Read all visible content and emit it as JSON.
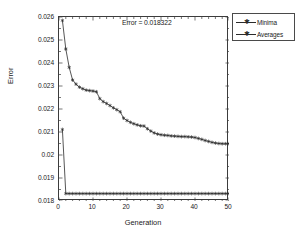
{
  "figure": {
    "background": "#ffffff",
    "axis_color": "#3c3c3c",
    "series_color": "#2b2b2b"
  },
  "annotation": {
    "text": "Error = 0.018322"
  },
  "axis": {
    "xlabel": "Generation",
    "ylabel": "Error",
    "yticks": [
      "0.018",
      "0.019",
      "0.02",
      "0.021",
      "0.022",
      "0.023",
      "0.024",
      "0.025",
      "0.026"
    ],
    "xticks": [
      "0",
      "10",
      "20",
      "30",
      "40",
      "50"
    ]
  },
  "legend": {
    "items": [
      {
        "label": "Minima",
        "marker": "star",
        "color": "#2b2b2b"
      },
      {
        "label": "Averages",
        "marker": "star",
        "color": "#2b2b2b"
      }
    ]
  },
  "chart_data": {
    "type": "line",
    "title": "",
    "subtitle": "",
    "xlabel": "Generation",
    "ylabel": "Error",
    "xlim": [
      0,
      50
    ],
    "ylim": [
      0.018,
      0.026
    ],
    "xticks": [
      0,
      10,
      20,
      30,
      40,
      50
    ],
    "yticks": [
      0.018,
      0.019,
      0.02,
      0.021,
      0.022,
      0.023,
      0.024,
      0.025,
      0.026
    ],
    "grid": false,
    "legend_position": "outside-top-right",
    "annotations": [
      {
        "text": "Error = 0.018322",
        "x": 25,
        "y": 0.02565
      }
    ],
    "x": [
      1,
      2,
      3,
      4,
      5,
      6,
      7,
      8,
      9,
      10,
      11,
      12,
      13,
      14,
      15,
      16,
      17,
      18,
      19,
      20,
      21,
      22,
      23,
      24,
      25,
      26,
      27,
      28,
      29,
      30,
      31,
      32,
      33,
      34,
      35,
      36,
      37,
      38,
      39,
      40,
      41,
      42,
      43,
      44,
      45,
      46,
      47,
      48,
      49,
      50
    ],
    "series": [
      {
        "name": "Minima",
        "marker": "star",
        "color": "#2b2b2b",
        "values": [
          0.02585,
          0.02461,
          0.02381,
          0.02326,
          0.02308,
          0.02295,
          0.02288,
          0.02282,
          0.0228,
          0.02278,
          0.02275,
          0.02245,
          0.02232,
          0.02224,
          0.02215,
          0.02205,
          0.02197,
          0.02188,
          0.0216,
          0.0215,
          0.02142,
          0.02136,
          0.02131,
          0.02127,
          0.02126,
          0.02114,
          0.02104,
          0.02096,
          0.02091,
          0.02088,
          0.02086,
          0.02085,
          0.02083,
          0.02082,
          0.02081,
          0.0208,
          0.0208,
          0.02079,
          0.02078,
          0.02076,
          0.02072,
          0.02068,
          0.02063,
          0.02059,
          0.02055,
          0.02052,
          0.0205,
          0.02049,
          0.02049,
          0.02049
        ]
      },
      {
        "name": "Averages",
        "marker": "star",
        "color": "#2b2b2b",
        "values": [
          0.02111,
          0.018322,
          0.018322,
          0.018322,
          0.018322,
          0.018322,
          0.018322,
          0.018322,
          0.018322,
          0.018322,
          0.018322,
          0.018322,
          0.018322,
          0.018322,
          0.018322,
          0.018322,
          0.018322,
          0.018322,
          0.018322,
          0.018322,
          0.018322,
          0.018322,
          0.018322,
          0.018322,
          0.018322,
          0.018322,
          0.018322,
          0.018322,
          0.018322,
          0.018322,
          0.018322,
          0.018322,
          0.018322,
          0.018322,
          0.018322,
          0.018322,
          0.018322,
          0.018322,
          0.018322,
          0.018322,
          0.018322,
          0.018322,
          0.018322,
          0.018322,
          0.018322,
          0.018322,
          0.018322,
          0.018322,
          0.018322,
          0.018322
        ]
      }
    ]
  }
}
